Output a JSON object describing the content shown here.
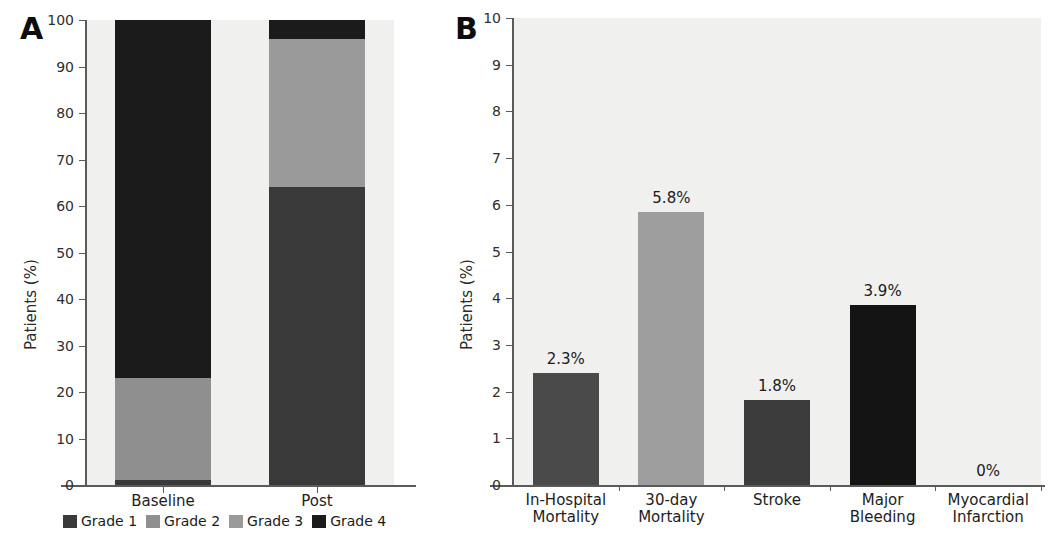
{
  "figure": {
    "panel_a_letter": "A",
    "panel_b_letter": "B"
  },
  "chart_data": [
    {
      "type": "bar",
      "panel": "A",
      "title": "",
      "xlabel": "",
      "ylabel": "Patients (%)",
      "ylim": [
        0,
        100
      ],
      "ytick_labels": [
        "0",
        "10",
        "20",
        "30",
        "40",
        "50",
        "60",
        "70",
        "80",
        "90",
        "100"
      ],
      "yticks": [
        0,
        10,
        20,
        30,
        40,
        50,
        60,
        70,
        80,
        90,
        100
      ],
      "grid": false,
      "stacked": true,
      "legend_position": "bottom",
      "categories": [
        "Baseline",
        "Post"
      ],
      "series": [
        {
          "name": "Grade 1",
          "color": "#3a3a3a",
          "values": [
            1,
            64
          ]
        },
        {
          "name": "Grade 2",
          "color": "#8f8f8f",
          "values": [
            22,
            0
          ]
        },
        {
          "name": "Grade 3",
          "color": "#9a9a9a",
          "values": [
            0,
            32
          ]
        },
        {
          "name": "Grade 4",
          "color": "#1b1b1b",
          "values": [
            77,
            4
          ]
        }
      ]
    },
    {
      "type": "bar",
      "panel": "B",
      "title": "",
      "xlabel": "",
      "ylabel": "Patients (%)",
      "ylim": [
        0,
        10
      ],
      "ytick_labels": [
        "0",
        "1",
        "2",
        "3",
        "4",
        "5",
        "6",
        "7",
        "8",
        "9",
        "10"
      ],
      "yticks": [
        0,
        1,
        2,
        3,
        4,
        5,
        6,
        7,
        8,
        9,
        10
      ],
      "grid": false,
      "stacked": false,
      "legend_position": "none",
      "categories": [
        "In-Hospital\nMortality",
        "30-day\nMortality",
        "Stroke",
        "Major\nBleeding",
        "Myocardial\nInfarction"
      ],
      "values": [
        2.4,
        5.85,
        1.82,
        3.85,
        0
      ],
      "data_labels": [
        "2.3%",
        "5.8%",
        "1.8%",
        "3.9%",
        "0%"
      ],
      "bar_colors": [
        "#4a4a4a",
        "#9e9e9e",
        "#3c3c3c",
        "#141414",
        "#141414"
      ]
    }
  ]
}
